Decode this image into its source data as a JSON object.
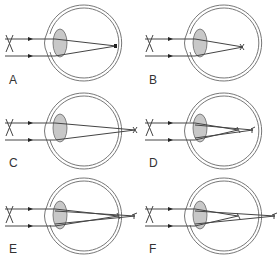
{
  "figure": {
    "colors": {
      "line": "#555555",
      "lens_fill": "#c8c8c8",
      "eye_wall": "#777777",
      "background": "#ffffff"
    },
    "panels": [
      {
        "label": "A",
        "condition": "focus on retina",
        "focus": "single",
        "focal_x": [
          114
        ]
      },
      {
        "label": "B",
        "condition": "focus in front of retina",
        "focus": "single",
        "focal_x": [
          105
        ]
      },
      {
        "label": "C",
        "condition": "focus behind retina",
        "focus": "single",
        "focal_x": [
          135
        ]
      },
      {
        "label": "D",
        "condition": "two focal lines in front of retina",
        "focus": "double",
        "focal_x": [
          98,
          113
        ]
      },
      {
        "label": "E",
        "condition": "one focal line on retina, one behind",
        "focus": "double",
        "focal_x": [
          118,
          135
        ]
      },
      {
        "label": "F",
        "condition": "one focal line in front of retina, one behind",
        "focus": "double",
        "focal_x": [
          98,
          135
        ]
      }
    ]
  }
}
